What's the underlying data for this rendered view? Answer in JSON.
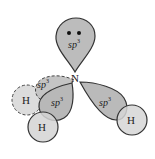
{
  "diagram": {
    "central_atom": "N",
    "lone_pair_orbital": {
      "label": "sp",
      "superscript": "3",
      "electrons": 2
    },
    "bonding_orbitals": [
      {
        "label": "sp",
        "superscript": "3",
        "position": "front-left",
        "style": "solid"
      },
      {
        "label": "sp",
        "superscript": "3",
        "position": "back-left",
        "style": "dashed"
      },
      {
        "label": "sp",
        "superscript": "3",
        "position": "right",
        "style": "solid"
      }
    ],
    "hydrogens": [
      {
        "label": "H",
        "position": "left",
        "style": "dashed"
      },
      {
        "label": "H",
        "position": "bottom",
        "style": "solid"
      },
      {
        "label": "H",
        "position": "right",
        "style": "solid"
      }
    ],
    "colors": {
      "orbital_fill": "#bdbdbd",
      "hydrogen_fill": "#d9d9d9",
      "outline": "#333333",
      "background": "#ffffff"
    }
  }
}
